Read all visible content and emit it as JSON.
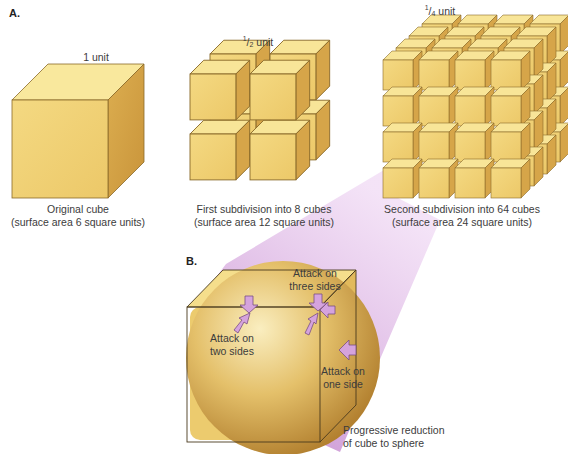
{
  "panel_a": {
    "label": "A.",
    "cubes": [
      {
        "dimension_label": "1 unit",
        "caption_line1": "Original cube",
        "caption_line2": "(surface area 6 square units)",
        "count": 1
      },
      {
        "dimension_num": "1",
        "dimension_den": "2",
        "dimension_unit": " unit",
        "caption_line1": "First subdivision into 8 cubes",
        "caption_line2": "(surface area 12 square units)",
        "count": 8
      },
      {
        "dimension_num": "1",
        "dimension_den": "4",
        "dimension_unit": " unit",
        "caption_line1": "Second subdivision into 64 cubes",
        "caption_line2": "(surface area 24 square units)",
        "count": 64
      }
    ]
  },
  "panel_b": {
    "label": "B.",
    "annotations": {
      "three_sides": [
        "Attack on",
        "three sides"
      ],
      "two_sides": [
        "Attack on",
        "two sides"
      ],
      "one_side": [
        "Attack on",
        "one side"
      ]
    },
    "caption_line1": "Progressive reduction",
    "caption_line2": "of cube to sphere"
  },
  "colors": {
    "cube_top": "#f8e79a",
    "cube_front": "#f1d274",
    "cube_side": "#d9a94a",
    "cube_edge": "#8a6a2a",
    "sphere_light": "#f6e3a6",
    "sphere_dark": "#b8852c",
    "arrow_fill": "#d7a6de",
    "arrow_stroke": "#7a4f83",
    "funnel": "#c98fd4"
  }
}
